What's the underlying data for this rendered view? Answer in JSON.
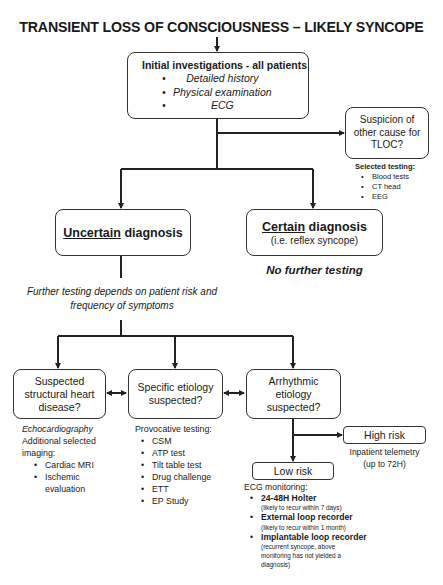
{
  "title": "TRANSIENT LOSS OF CONSCIOUSNESS – LIKELY SYNCOPE",
  "initial": {
    "heading": "Initial investigations - all patients",
    "items": [
      "Detailed history",
      "Physical examination",
      "ECG"
    ]
  },
  "other_cause": {
    "label": "Suspicion of other cause for TLOC?",
    "line1": "Suspicion of",
    "line2": "other cause for",
    "line3": "TLOC?",
    "testing_heading": "Selected testing:",
    "testing_items": [
      "Blood tests",
      "CT head",
      "EEG"
    ]
  },
  "uncertain": {
    "underlined": "Uncertain",
    "rest": " diagnosis"
  },
  "certain": {
    "underlined": "Certain",
    "rest": " diagnosis",
    "sub": "(i.e. reflex syncope)",
    "note": "No further testing"
  },
  "further_testing": {
    "line1": "Further testing depends on patient risk and",
    "line2": "frequency of symptoms"
  },
  "structural": {
    "line1": "Suspected",
    "line2": "structural heart",
    "line3": "disease?",
    "echo": "Echocardiography",
    "additional_line1": "Additional selected",
    "additional_line2": "imaging:",
    "items": [
      "Cardiac MRI",
      "Ischemic evaluation"
    ]
  },
  "specific": {
    "line1": "Specific etiology",
    "line2": "suspected?",
    "testing_heading": "Provocative testing:",
    "items": [
      "CSM",
      "ATP test",
      "Tilt table test",
      "Drug challenge",
      "ETT",
      "EP Study"
    ]
  },
  "arrhythmic": {
    "line1": "Arrhythmic",
    "line2": "etiology",
    "line3": "suspected?"
  },
  "high_risk": {
    "label": "High risk",
    "note_line1": "Inpatient telemetry",
    "note_line2": "(up to 72H)"
  },
  "low_risk": {
    "label": "Low risk",
    "monitoring_heading": "ECG monitoring:",
    "items": [
      {
        "name": "24-48H Holter",
        "detail": "(likely to recur within 7 days)"
      },
      {
        "name": "External loop recorder",
        "detail": "(likely to recur within 1 month)"
      },
      {
        "name": "Implantable loop recorder",
        "detail": "(recurrent syncope, above monitoring has not yielded a diagnosis)"
      }
    ]
  },
  "colors": {
    "line": "#222222",
    "text": "#1a1a1a",
    "background": "#ffffff"
  }
}
